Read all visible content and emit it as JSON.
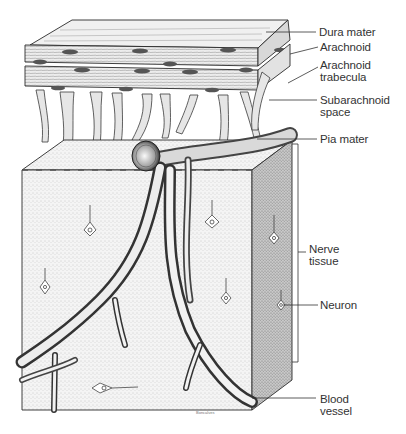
{
  "figure": {
    "labels": [
      {
        "id": "dura-mater",
        "text": "Dura mater",
        "x": 319,
        "y": 26,
        "line": [
          [
            266,
            32
          ],
          [
            316,
            32
          ]
        ]
      },
      {
        "id": "arachnoid",
        "text": "Arachnoid",
        "x": 320,
        "y": 41,
        "line": [
          [
            290,
            54
          ],
          [
            318,
            47
          ]
        ]
      },
      {
        "id": "arachnoid-trabecula",
        "text": "Arachnoid\ntrabecula",
        "x": 320,
        "y": 59,
        "line": [
          [
            288,
            83
          ],
          [
            318,
            67
          ]
        ]
      },
      {
        "id": "subarachnoid-space",
        "text": "Subarachnoid\nspace",
        "x": 320,
        "y": 94,
        "line": [
          [
            269,
            100
          ],
          [
            317,
            100
          ]
        ]
      },
      {
        "id": "pia-mater",
        "text": "Pia mater",
        "x": 320,
        "y": 133,
        "line": [
          [
            257,
            139
          ],
          [
            317,
            139
          ]
        ]
      },
      {
        "id": "nerve-tissue",
        "text": "Nerve\ntissue",
        "x": 309,
        "y": 243,
        "bracket": {
          "x": 298,
          "y1": 144,
          "y2": 362,
          "tick": 292,
          "label_y": 252
        }
      },
      {
        "id": "neuron",
        "text": "Neuron",
        "x": 320,
        "y": 299,
        "line": [
          [
            283,
            305
          ],
          [
            318,
            305
          ]
        ]
      },
      {
        "id": "blood-vessel",
        "text": "Blood\nvessel",
        "x": 320,
        "y": 393,
        "line": [
          [
            252,
            398
          ],
          [
            316,
            398
          ]
        ]
      }
    ],
    "signature": "Boncalves"
  },
  "colors": {
    "ink": "#2a2a2a",
    "label_text": "#333333",
    "stipple": "#cfcfcf",
    "side_face": "#a9a9a9",
    "background": "#ffffff"
  }
}
